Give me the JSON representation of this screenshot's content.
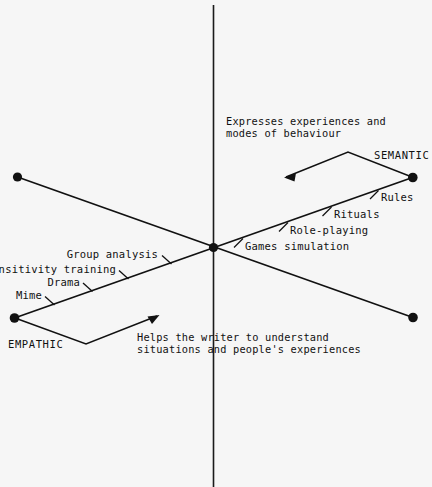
{
  "diagram": {
    "background_color": "#f6f6f6",
    "ink_color": "#111111",
    "poles": {
      "semantic_label": "SEMANTIC",
      "empathic_label": "EMPATHIC"
    },
    "captions": {
      "semantic_caption_line1": "Expresses experiences and",
      "semantic_caption_line2": "modes of behaviour",
      "empathic_caption_line1": "Helps the writer to understand",
      "empathic_caption_line2": "situations and people's experiences"
    },
    "semantic_side_items": [
      {
        "label": "Rules"
      },
      {
        "label": "Rituals"
      },
      {
        "label": "Role-playing"
      },
      {
        "label": "Games simulation"
      }
    ],
    "empathic_side_items": [
      {
        "label": "Group analysis"
      },
      {
        "label": "Sensitivity training"
      },
      {
        "label": "Drama"
      },
      {
        "label": "Mime"
      }
    ]
  }
}
